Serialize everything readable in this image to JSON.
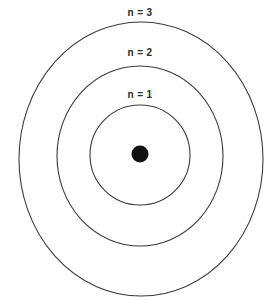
{
  "figure": {
    "background_color": "#ffffff",
    "width": 279,
    "height": 301
  },
  "style": {
    "ring_stroke_color": "#3b3b3b",
    "ring_stroke_width": 1.1,
    "nucleus_fill_color": "#111111",
    "label_color": "#2b2b2b",
    "label_font_size": 10
  },
  "nucleus": {
    "label": "nucleus",
    "center_x": 140,
    "center_y": 154,
    "radius": 8.5
  },
  "shells": [
    {
      "id": "shell-1",
      "label": "n = 1",
      "quantum_number": 1,
      "center_x": 140,
      "center_y": 155,
      "radius_x": 50,
      "radius_y": 50,
      "label_x": 140,
      "label_y": 95
    },
    {
      "id": "shell-2",
      "label": "n = 2",
      "quantum_number": 2,
      "center_x": 140,
      "center_y": 156,
      "radius_x": 83,
      "radius_y": 90,
      "label_x": 140,
      "label_y": 53
    },
    {
      "id": "shell-3",
      "label": "n = 3",
      "quantum_number": 3,
      "center_x": 141,
      "center_y": 159,
      "radius_x": 122,
      "radius_y": 137,
      "label_x": 140,
      "label_y": 13
    }
  ]
}
